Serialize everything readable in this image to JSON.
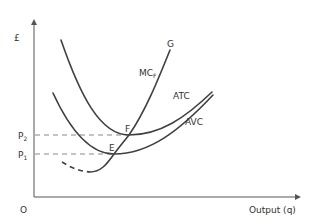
{
  "diagram": {
    "type": "cost-curves",
    "y_axis_label": "£",
    "x_axis_label": "Output (q)",
    "origin_label": "O",
    "price_labels": {
      "p2": "P",
      "p2_sub": "2",
      "p1": "P",
      "p1_sub": "1"
    },
    "curve_labels": {
      "mc": "MC",
      "mc_sub": "F",
      "g": "G",
      "atc": "ATC",
      "avc": "AVC"
    },
    "point_labels": {
      "f": "F",
      "e": "E"
    },
    "colors": {
      "curve": "#404040",
      "dashed": "#888888",
      "axis": "#555555",
      "text": "#333333"
    }
  }
}
